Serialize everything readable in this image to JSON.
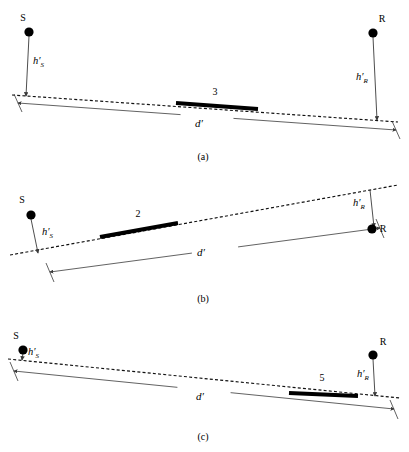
{
  "figure": {
    "background_color": "#ffffff",
    "ink_color": "#000000",
    "dimension_color": "#3a3a3a",
    "width": 409,
    "height": 452
  },
  "labels": {
    "source_node": "S",
    "receiver_node": "R",
    "height_symbol": "h",
    "height_prime": "′",
    "height_sub_source": "S",
    "height_sub_receiver": "R",
    "distance": "d′"
  },
  "panels": [
    {
      "id": "a",
      "caption": "(a)",
      "caption_x": 203,
      "caption_y": 160,
      "source_label": "S",
      "source_label_x": 23,
      "source_label_y": 21,
      "source_dot": {
        "x": 29,
        "y": 32,
        "r": 4.6
      },
      "receiver_label": "R",
      "receiver_label_x": 382,
      "receiver_label_y": 22,
      "receiver_dot": {
        "x": 373,
        "y": 33,
        "r": 4.6
      },
      "terrain": {
        "x1": 12,
        "y1": 95,
        "x2": 398,
        "y2": 122
      },
      "height_source": {
        "x1": 29,
        "y1": 36,
        "x2": 26,
        "y2": 96,
        "label_x": 33,
        "label_y": 64
      },
      "height_receiver": {
        "x1": 373,
        "y1": 37,
        "x2": 377,
        "y2": 120,
        "label_x": 356,
        "label_y": 80
      },
      "distance": {
        "x1": 18,
        "y1": 103,
        "x2": 396,
        "y2": 130,
        "label_x": 199,
        "label_y": 127,
        "tick_left": {
          "x1": 14,
          "y1": 94,
          "x2": 22,
          "y2": 112
        },
        "tick_right": {
          "x1": 392,
          "y1": 121,
          "x2": 400,
          "y2": 139
        }
      },
      "obstacle": {
        "label": "3",
        "label_x": 215,
        "label_y": 95,
        "x1": 176,
        "y1": 103,
        "x2": 258,
        "y2": 109
      }
    },
    {
      "id": "b",
      "caption": "(b)",
      "caption_x": 203,
      "caption_y": 302,
      "source_label": "S",
      "source_label_x": 22,
      "source_label_y": 203,
      "source_dot": {
        "x": 31,
        "y": 215,
        "r": 4.6
      },
      "receiver_label": "R",
      "receiver_label_x": 383,
      "receiver_label_y": 232,
      "receiver_dot": {
        "x": 372,
        "y": 229,
        "r": 4.6
      },
      "terrain": {
        "x1": 10,
        "y1": 255,
        "x2": 398,
        "y2": 185
      },
      "height_source": {
        "x1": 31,
        "y1": 219,
        "x2": 38,
        "y2": 253,
        "label_x": 42,
        "label_y": 235
      },
      "height_receiver": {
        "x1": 370,
        "y1": 190,
        "x2": 374,
        "y2": 227,
        "label_x": 353,
        "label_y": 206
      },
      "distance": {
        "x1": 50,
        "y1": 272,
        "x2": 380,
        "y2": 228,
        "label_x": 201,
        "label_y": 256,
        "tick_left": {
          "x1": 46,
          "y1": 263,
          "x2": 54,
          "y2": 282
        },
        "tick_right": {
          "x1": 376,
          "y1": 219,
          "x2": 384,
          "y2": 238
        }
      },
      "obstacle": {
        "label": "2",
        "label_x": 138,
        "label_y": 217,
        "x1": 100,
        "y1": 237,
        "x2": 178,
        "y2": 223
      }
    },
    {
      "id": "c",
      "caption": "(c)",
      "caption_x": 203,
      "caption_y": 440,
      "source_label": "S",
      "source_label_x": 16,
      "source_label_y": 339,
      "source_dot": {
        "x": 23,
        "y": 350,
        "r": 4.6
      },
      "receiver_label": "R",
      "receiver_label_x": 383,
      "receiver_label_y": 345,
      "receiver_dot": {
        "x": 373,
        "y": 355,
        "r": 4.6
      },
      "terrain": {
        "x1": 8,
        "y1": 359,
        "x2": 400,
        "y2": 398
      },
      "height_source": {
        "x1": 23,
        "y1": 353,
        "x2": 22,
        "y2": 360,
        "label_x": 28,
        "label_y": 355
      },
      "height_receiver": {
        "x1": 373,
        "y1": 359,
        "x2": 375,
        "y2": 396,
        "label_x": 357,
        "label_y": 377
      },
      "distance": {
        "x1": 14,
        "y1": 371,
        "x2": 394,
        "y2": 409,
        "label_x": 200,
        "label_y": 400,
        "tick_left": {
          "x1": 10,
          "y1": 362,
          "x2": 18,
          "y2": 381
        },
        "tick_right": {
          "x1": 390,
          "y1": 400,
          "x2": 398,
          "y2": 419
        }
      },
      "obstacle": {
        "label": "5",
        "label_x": 322,
        "label_y": 381,
        "x1": 289,
        "y1": 393,
        "x2": 358,
        "y2": 396
      }
    }
  ]
}
